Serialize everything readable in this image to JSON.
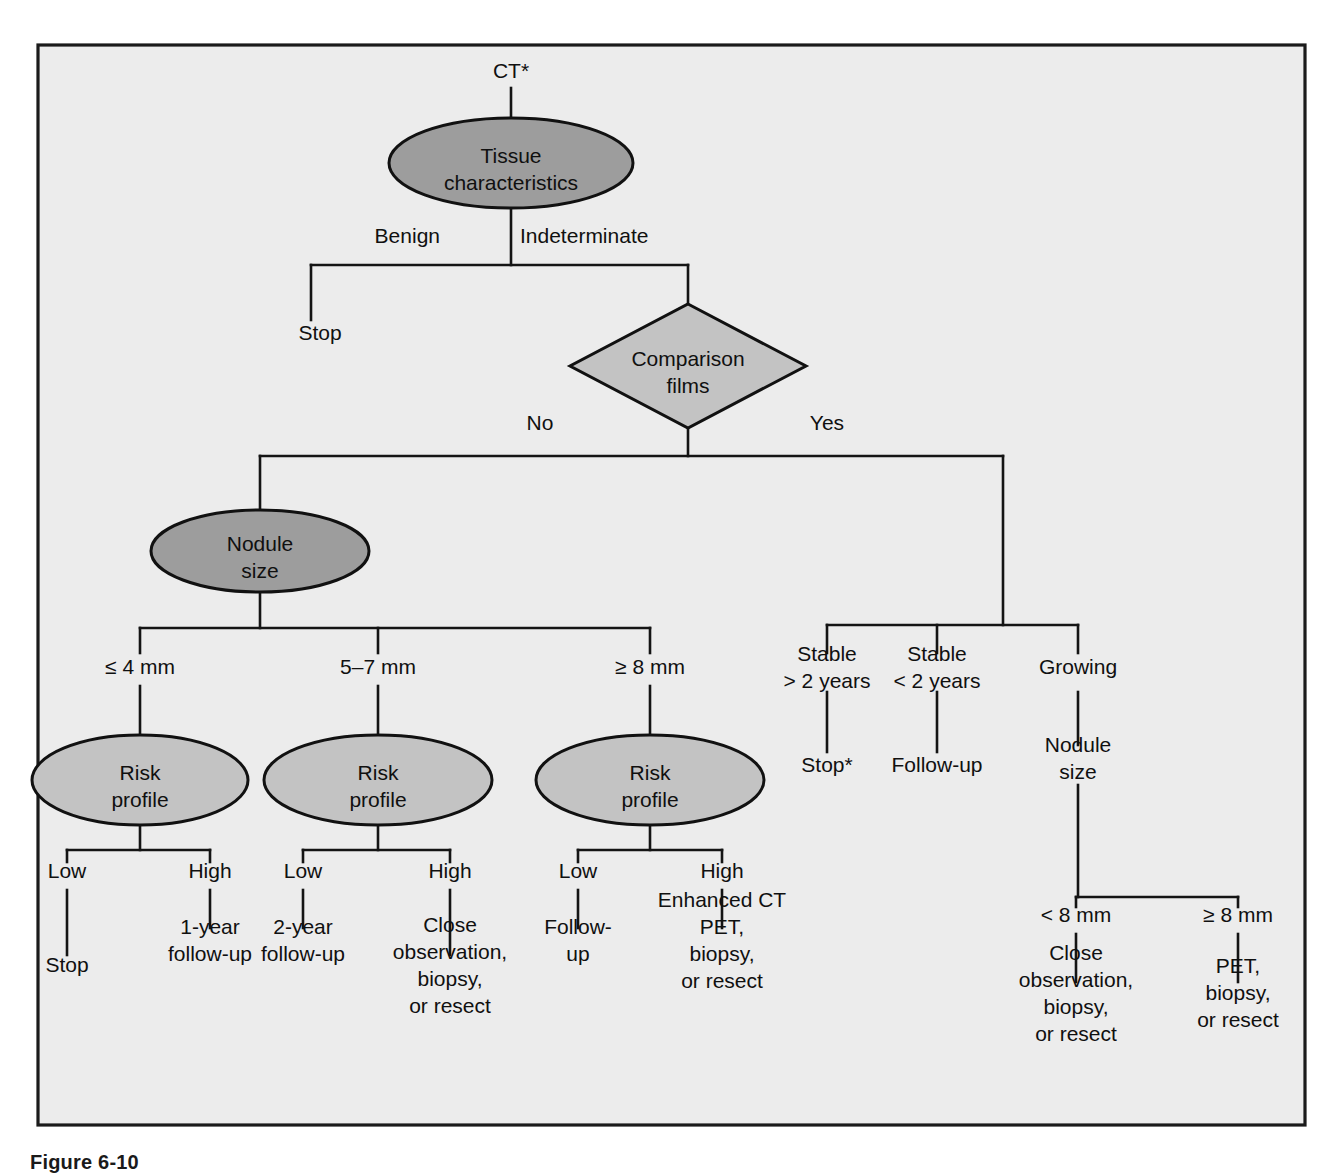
{
  "figure": {
    "caption": "Figure 6-10",
    "frame": {
      "x": 38,
      "y": 45,
      "width": 1267,
      "height": 1080,
      "fill": "#ececec",
      "stroke": "#1b1b1b"
    }
  },
  "palette": {
    "decision_dark": "#9d9d9d",
    "decision_light": "#c3c3c3",
    "line": "#141414",
    "text": "#101010",
    "background": "#ececec"
  },
  "chart_data": {
    "type": "diagram",
    "entry_label": "CT*",
    "nodes": [
      {
        "id": "tissue",
        "label": "Tissue characteristics",
        "lines": [
          "Tissue",
          "characteristics"
        ],
        "shape": "ellipse",
        "fill": "decision_dark",
        "cx": 511,
        "cy": 163,
        "rx": 122,
        "ry": 45
      },
      {
        "id": "comparison",
        "label": "Comparison films",
        "lines": [
          "Comparison",
          "films"
        ],
        "shape": "diamond",
        "fill": "decision_light",
        "cx": 688,
        "cy": 366,
        "rx": 118,
        "ry": 62
      },
      {
        "id": "nodule_size",
        "label": "Nodule size",
        "lines": [
          "Nodule",
          "size"
        ],
        "shape": "ellipse",
        "fill": "decision_dark",
        "cx": 260,
        "cy": 551,
        "rx": 109,
        "ry": 41
      },
      {
        "id": "risk1",
        "label": "Risk profile",
        "lines": [
          "Risk",
          "profile"
        ],
        "shape": "ellipse",
        "fill": "decision_light",
        "cx": 140,
        "cy": 780,
        "rx": 108,
        "ry": 45
      },
      {
        "id": "risk2",
        "label": "Risk profile",
        "lines": [
          "Risk",
          "profile"
        ],
        "shape": "ellipse",
        "fill": "decision_light",
        "cx": 378,
        "cy": 780,
        "rx": 114,
        "ry": 45
      },
      {
        "id": "risk3",
        "label": "Risk profile",
        "lines": [
          "Risk",
          "profile"
        ],
        "shape": "ellipse",
        "fill": "decision_light",
        "cx": 650,
        "cy": 780,
        "rx": 114,
        "ry": 45
      }
    ],
    "branch_labels": [
      {
        "id": "benign",
        "text": "Benign",
        "x": 440,
        "y": 243,
        "anchor": "end"
      },
      {
        "id": "indeterminate",
        "text": "Indeterminate",
        "x": 520,
        "y": 243,
        "anchor": "start"
      },
      {
        "id": "no",
        "text": "No",
        "x": 540,
        "y": 430,
        "anchor": "middle"
      },
      {
        "id": "yes",
        "text": "Yes",
        "x": 827,
        "y": 430,
        "anchor": "middle"
      },
      {
        "id": "le4mm",
        "text": "≤ 4 mm",
        "x": 140,
        "y": 674,
        "anchor": "middle"
      },
      {
        "id": "mm5to7",
        "text": "5–7 mm",
        "x": 378,
        "y": 674,
        "anchor": "middle"
      },
      {
        "id": "ge8mm",
        "text": "≥ 8 mm",
        "x": 650,
        "y": 674,
        "anchor": "middle"
      },
      {
        "id": "low1",
        "text": "Low",
        "x": 67,
        "y": 878,
        "anchor": "middle"
      },
      {
        "id": "high1",
        "text": "High",
        "x": 210,
        "y": 878,
        "anchor": "middle"
      },
      {
        "id": "low2",
        "text": "Low",
        "x": 303,
        "y": 878,
        "anchor": "middle"
      },
      {
        "id": "high2",
        "text": "High",
        "x": 450,
        "y": 878,
        "anchor": "middle"
      },
      {
        "id": "low3",
        "text": "Low",
        "x": 578,
        "y": 878,
        "anchor": "middle"
      },
      {
        "id": "high3",
        "text": "High",
        "x": 722,
        "y": 878,
        "anchor": "middle"
      },
      {
        "id": "lt8mm",
        "text": "< 8 mm",
        "x": 1076,
        "y": 922,
        "anchor": "middle"
      },
      {
        "id": "ge8mm_grow",
        "text": "≥ 8 mm",
        "x": 1238,
        "y": 922,
        "anchor": "middle"
      }
    ],
    "terminals": [
      {
        "id": "stop_benign",
        "lines": [
          "Stop"
        ],
        "x": 320,
        "y": 340,
        "anchor": "middle"
      },
      {
        "id": "stable_gt2",
        "lines": [
          "Stable",
          "> 2 years"
        ],
        "x": 827,
        "y": 674,
        "anchor": "middle"
      },
      {
        "id": "stop_star",
        "lines": [
          "Stop*"
        ],
        "x": 827,
        "y": 772,
        "anchor": "middle"
      },
      {
        "id": "stable_lt2",
        "lines": [
          "Stable",
          "< 2 years"
        ],
        "x": 937,
        "y": 674,
        "anchor": "middle"
      },
      {
        "id": "followup_stable",
        "lines": [
          "Follow-up"
        ],
        "x": 937,
        "y": 772,
        "anchor": "middle"
      },
      {
        "id": "growing",
        "lines": [
          "Growing"
        ],
        "x": 1078,
        "y": 674,
        "anchor": "middle"
      },
      {
        "id": "nodule_size_grow",
        "lines": [
          "Nodule",
          "size"
        ],
        "x": 1078,
        "y": 765,
        "anchor": "middle"
      },
      {
        "id": "stop_low1",
        "lines": [
          "Stop"
        ],
        "x": 67,
        "y": 972,
        "anchor": "middle"
      },
      {
        "id": "oneyear_high1",
        "lines": [
          "1-year",
          "follow-up"
        ],
        "x": 210,
        "y": 947,
        "anchor": "middle"
      },
      {
        "id": "twoyear_low2",
        "lines": [
          "2-year",
          "follow-up"
        ],
        "x": 303,
        "y": 947,
        "anchor": "middle"
      },
      {
        "id": "close_obs_high2",
        "lines": [
          "Close",
          "observation,",
          "biopsy,",
          "or resect"
        ],
        "x": 450,
        "y": 972,
        "anchor": "middle"
      },
      {
        "id": "followup_low3",
        "lines": [
          "Follow-",
          "up"
        ],
        "x": 578,
        "y": 947,
        "anchor": "middle"
      },
      {
        "id": "enhanced_high3",
        "lines": [
          "Enhanced CT",
          "PET,",
          "biopsy,",
          "or resect"
        ],
        "x": 722,
        "y": 947,
        "anchor": "middle"
      },
      {
        "id": "close_obs_lt8",
        "lines": [
          "Close",
          "observation,",
          "biopsy,",
          "or resect"
        ],
        "x": 1076,
        "y": 1000,
        "anchor": "middle"
      },
      {
        "id": "pet_ge8",
        "lines": [
          "PET,",
          "biopsy,",
          "or resect"
        ],
        "x": 1238,
        "y": 1000,
        "anchor": "middle"
      }
    ],
    "edges": [
      {
        "id": "entry-to-tissue",
        "d": "M 511 88 L 511 118"
      },
      {
        "id": "tissue-to-split",
        "d": "M 511 208 L 511 265"
      },
      {
        "id": "tissue-split-bar",
        "d": "M 311 265 L 688 265"
      },
      {
        "id": "benign-drop",
        "d": "M 311 265 L 311 320"
      },
      {
        "id": "indeterminate-drop",
        "d": "M 688 265 L 688 304"
      },
      {
        "id": "comparison-to-split",
        "d": "M 688 428 L 688 456"
      },
      {
        "id": "comparison-split-bar",
        "d": "M 260 456 L 1003 456"
      },
      {
        "id": "no-drop",
        "d": "M 260 456 L 260 510"
      },
      {
        "id": "yes-drop",
        "d": "M 1003 456 L 1003 625"
      },
      {
        "id": "nodulesize-to-split",
        "d": "M 260 592 L 260 628"
      },
      {
        "id": "nodule-split-bar",
        "d": "M 140 628 L 650 628"
      },
      {
        "id": "le4-drop",
        "d": "M 140 628 L 140 653"
      },
      {
        "id": "mm57-drop",
        "d": "M 378 628 L 378 653"
      },
      {
        "id": "ge8-drop",
        "d": "M 650 628 L 650 653"
      },
      {
        "id": "le4-to-risk",
        "d": "M 140 686 L 140 735"
      },
      {
        "id": "mm57-to-risk",
        "d": "M 378 686 L 378 735"
      },
      {
        "id": "ge8-to-risk",
        "d": "M 650 686 L 650 735"
      },
      {
        "id": "risk1-stem",
        "d": "M 140 825 L 140 850"
      },
      {
        "id": "risk1-bar",
        "d": "M 67 850 L 210 850"
      },
      {
        "id": "risk1-low",
        "d": "M 67 850 L 67 862"
      },
      {
        "id": "risk1-high",
        "d": "M 210 850 L 210 862"
      },
      {
        "id": "risk2-stem",
        "d": "M 378 825 L 378 850"
      },
      {
        "id": "risk2-bar",
        "d": "M 303 850 L 450 850"
      },
      {
        "id": "risk2-low",
        "d": "M 303 850 L 303 862"
      },
      {
        "id": "risk2-high",
        "d": "M 450 850 L 450 862"
      },
      {
        "id": "risk3-stem",
        "d": "M 650 825 L 650 850"
      },
      {
        "id": "risk3-bar",
        "d": "M 578 850 L 722 850"
      },
      {
        "id": "risk3-low",
        "d": "M 578 850 L 578 862"
      },
      {
        "id": "risk3-high",
        "d": "M 722 850 L 722 862"
      },
      {
        "id": "low1-to-stop",
        "d": "M 67 890 L 67 955"
      },
      {
        "id": "high1-to-1yr",
        "d": "M 210 890 L 210 928"
      },
      {
        "id": "low2-to-2yr",
        "d": "M 303 890 L 303 928"
      },
      {
        "id": "high2-to-close",
        "d": "M 450 890 L 450 955"
      },
      {
        "id": "low3-to-followup",
        "d": "M 578 890 L 578 928"
      },
      {
        "id": "high3-to-enh",
        "d": "M 722 890 L 722 928"
      },
      {
        "id": "yes-split-bar",
        "d": "M 827 625 L 1078 625"
      },
      {
        "id": "stable2y-drop",
        "d": "M 827 625 L 827 653"
      },
      {
        "id": "stablelt2-drop",
        "d": "M 937 625 L 937 653"
      },
      {
        "id": "growing-drop",
        "d": "M 1078 625 L 1078 653"
      },
      {
        "id": "stable2y-to-stop",
        "d": "M 827 692 L 827 752"
      },
      {
        "id": "stablelt2-to-fu",
        "d": "M 937 692 L 937 752"
      },
      {
        "id": "growing-to-nodule",
        "d": "M 1078 692 L 1078 745"
      },
      {
        "id": "grownodule-stem",
        "d": "M 1078 785 L 1078 897"
      },
      {
        "id": "grow-split-bar",
        "d": "M 1076 897 L 1238 897"
      },
      {
        "id": "grow-lt8-drop",
        "d": "M 1076 897 L 1076 907"
      },
      {
        "id": "grow-ge8-drop",
        "d": "M 1238 897 L 1238 907"
      },
      {
        "id": "lt8-to-close",
        "d": "M 1076 934 L 1076 982"
      },
      {
        "id": "ge8-to-pet",
        "d": "M 1238 934 L 1238 982"
      }
    ]
  }
}
